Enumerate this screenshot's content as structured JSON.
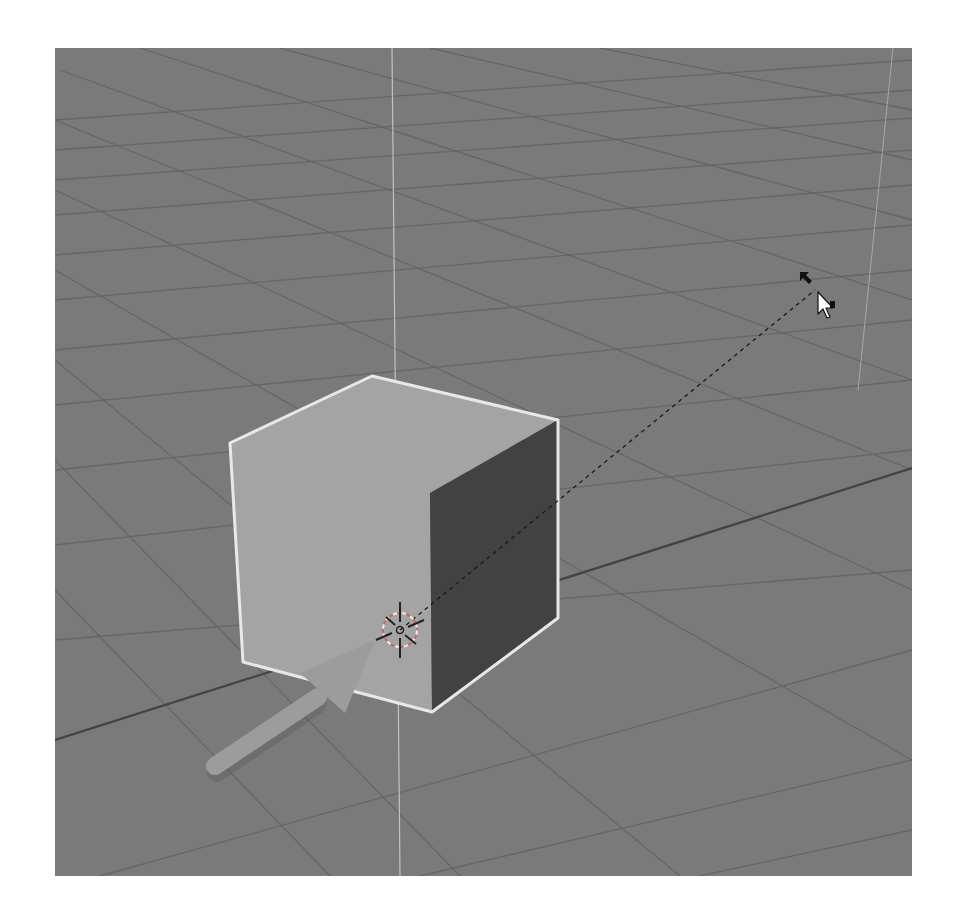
{
  "app": {
    "view": "3D Viewport",
    "scene_label": "3D viewport with selected cube"
  },
  "colors": {
    "background": "#ffffff",
    "floor": "#7a7a7a",
    "grid_line": "#5f5f5f",
    "axis_line": "#3e3e3e",
    "vertical_axis": "#c8c8c8",
    "cube_front": "#a8a8a8",
    "cube_top": "#a5a5a5",
    "cube_side": "#3d3d3d",
    "selection_outline": "#f2f2f2",
    "annotation_arrow": "#9a9a9a",
    "cursor_line": "#1a1a1a"
  },
  "scene": {
    "object": "Cube",
    "selected": true,
    "cursor_3d": "3d-cursor",
    "mouse_cursor": "arrow-pointer"
  }
}
